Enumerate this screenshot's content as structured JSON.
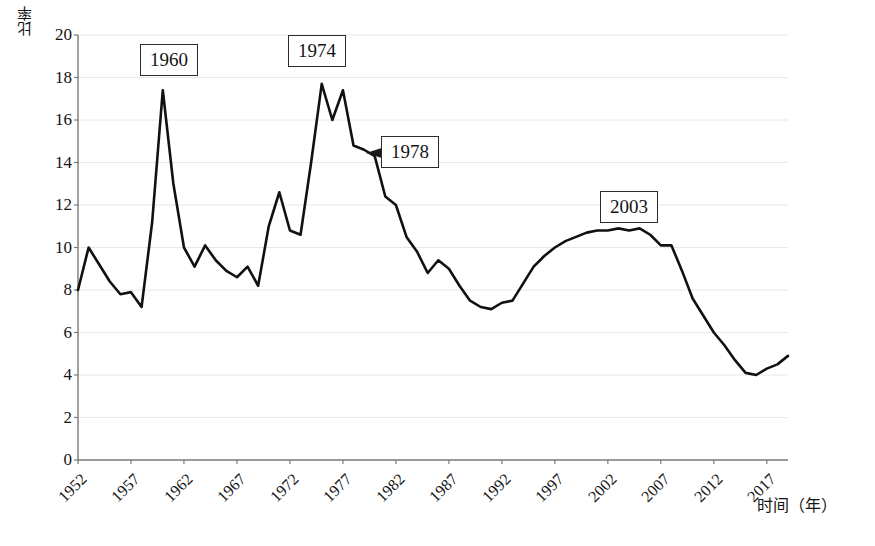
{
  "chart_data": {
    "type": "line",
    "title": "",
    "xlabel": "时间（年）",
    "ylabel": "比率",
    "xlim": [
      1952,
      2019
    ],
    "ylim": [
      0,
      20
    ],
    "grid": true,
    "legend": "none",
    "y_ticks": [
      0,
      2,
      4,
      6,
      8,
      10,
      12,
      14,
      16,
      18,
      20
    ],
    "x_ticks": [
      1952,
      1957,
      1962,
      1967,
      1972,
      1977,
      1982,
      1987,
      1992,
      1997,
      2002,
      2007,
      2012,
      2017
    ],
    "x_tick_labels": [
      "1952",
      "1957",
      "1962",
      "1967",
      "1972",
      "1977",
      "1982",
      "1987",
      "1992",
      "1997",
      "2002",
      "2007",
      "2012",
      "2017"
    ],
    "y_tick_labels": [
      "0",
      "2",
      "4",
      "6",
      "8",
      "10",
      "12",
      "14",
      "16",
      "18",
      "20"
    ],
    "line_color": "#111111",
    "line_width": 2.6,
    "grid_color": "#e8e8e8",
    "axis_color": "#7a7a7a",
    "x": [
      1952,
      1953,
      1954,
      1955,
      1956,
      1957,
      1958,
      1959,
      1960,
      1961,
      1962,
      1963,
      1964,
      1965,
      1966,
      1967,
      1968,
      1969,
      1970,
      1971,
      1972,
      1973,
      1974,
      1975,
      1976,
      1977,
      1978,
      1979,
      1980,
      1981,
      1982,
      1983,
      1984,
      1985,
      1986,
      1987,
      1988,
      1989,
      1990,
      1991,
      1992,
      1993,
      1994,
      1995,
      1996,
      1997,
      1998,
      1999,
      2000,
      2001,
      2002,
      2003,
      2004,
      2005,
      2006,
      2007,
      2008,
      2009,
      2010,
      2011,
      2012,
      2013,
      2014,
      2015,
      2016,
      2017,
      2018,
      2019
    ],
    "values": [
      8.0,
      10.0,
      9.2,
      8.4,
      7.8,
      7.9,
      7.2,
      11.2,
      17.4,
      13.0,
      10.0,
      9.1,
      10.1,
      9.4,
      8.9,
      8.6,
      9.1,
      8.2,
      11.0,
      12.6,
      10.8,
      10.6,
      14.0,
      17.7,
      16.0,
      17.4,
      14.8,
      14.6,
      14.3,
      12.4,
      12.0,
      10.5,
      9.8,
      8.8,
      9.4,
      9.0,
      8.2,
      7.5,
      7.2,
      7.1,
      7.4,
      7.5,
      8.3,
      9.1,
      9.6,
      10.0,
      10.3,
      10.5,
      10.7,
      10.8,
      10.8,
      10.9,
      10.8,
      10.9,
      10.6,
      10.1,
      10.1,
      8.9,
      7.6,
      6.8,
      6.0,
      5.4,
      4.7,
      4.1,
      4.0,
      4.3,
      4.5,
      4.9
    ],
    "annotations": [
      {
        "label": "1960",
        "type": "box",
        "has_arrow": false
      },
      {
        "label": "1974",
        "type": "box",
        "has_arrow": false
      },
      {
        "label": "1978",
        "type": "box",
        "has_arrow": true,
        "arrow_direction": "left"
      },
      {
        "label": "2003",
        "type": "box",
        "has_arrow": false
      }
    ]
  },
  "axis": {
    "y_title": "比率",
    "x_title": "时间（年）"
  },
  "callouts": {
    "c1960": "1960",
    "c1974": "1974",
    "c1978": "1978",
    "c2003": "2003"
  }
}
